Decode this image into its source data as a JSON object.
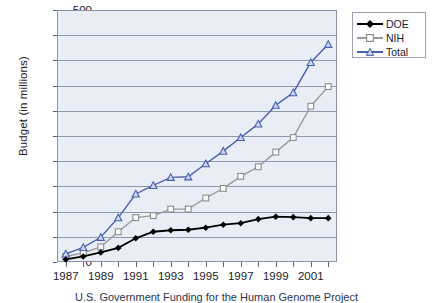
{
  "chart_data": {
    "type": "line",
    "title": "",
    "xlabel": "",
    "ylabel": "Budget (in millions)",
    "ylim": [
      0,
      500
    ],
    "ytick_step": 50,
    "yticks": [
      0,
      50,
      100,
      150,
      200,
      250,
      300,
      350,
      400,
      450,
      500
    ],
    "grid": true,
    "legend_position": "upper right",
    "categories": [
      1987,
      1988,
      1989,
      1990,
      1991,
      1992,
      1993,
      1994,
      1995,
      1996,
      1997,
      1998,
      1999,
      2000,
      2001,
      2002
    ],
    "xtick_labels": [
      "1987",
      "1989",
      "1991",
      "1993",
      "1995",
      "1997",
      "1999",
      "2001"
    ],
    "series": [
      {
        "name": "DOE",
        "color": "#000000",
        "marker": "diamond",
        "values": [
          5,
          11,
          19,
          28,
          47,
          60,
          63,
          64,
          68,
          74,
          77,
          85,
          90,
          89,
          87,
          87
        ]
      },
      {
        "name": "NIH",
        "color": "#9a9a9a",
        "marker": "square",
        "values": [
          11,
          18,
          30,
          60,
          88,
          92,
          105,
          105,
          127,
          146,
          170,
          189,
          218,
          247,
          309,
          348
        ]
      },
      {
        "name": "Total",
        "color": "#4a5fae",
        "marker": "triangle",
        "values": [
          16,
          29,
          49,
          88,
          135,
          152,
          168,
          169,
          195,
          220,
          247,
          274,
          311,
          336,
          396,
          432
        ]
      }
    ]
  },
  "axis": {
    "y_label": "Budget (in millions)"
  },
  "legend": {
    "entries": [
      {
        "label": "DOE"
      },
      {
        "label": "NIH"
      },
      {
        "label": "Total"
      }
    ]
  },
  "caption": {
    "text": "U.S. Government Funding for the Human Genome Project"
  }
}
